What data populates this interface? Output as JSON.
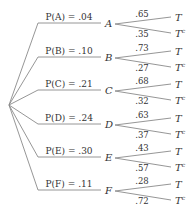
{
  "diagram": {
    "type": "probability-tree",
    "root": {
      "x": 9,
      "y": 105
    },
    "branches": [
      {
        "node": "A",
        "label": "P(A) = .04",
        "y": 23,
        "t": ".65",
        "tc": ".35"
      },
      {
        "node": "B",
        "label": "P(B) = .10",
        "y": 57,
        "t": ".73",
        "tc": ".27"
      },
      {
        "node": "C",
        "label": "P(C) = .21",
        "y": 90,
        "t": ".68",
        "tc": ".32"
      },
      {
        "node": "D",
        "label": "P(D) = .24",
        "y": 124,
        "t": ".63",
        "tc": ".37"
      },
      {
        "node": "E",
        "label": "P(E) = .30",
        "y": 157,
        "t": ".43",
        "tc": ".57"
      },
      {
        "node": "F",
        "label": "P(F) = .11",
        "y": 190,
        "t": ".28",
        "tc": ".72"
      }
    ],
    "leaf_labels": {
      "t": "T",
      "tc_base": "T",
      "tc_sup": "c"
    },
    "colors": {
      "line": "#8a8a8a",
      "text": "#333333",
      "background": "#ffffff"
    }
  }
}
